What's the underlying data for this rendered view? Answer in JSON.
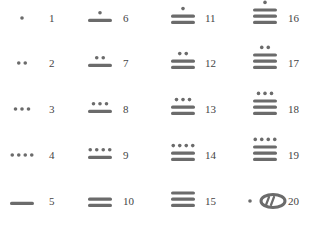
{
  "colors": {
    "glyph": "#6b6b6b",
    "label": "#444444",
    "background": "#ffffff"
  },
  "layout": {
    "columns": [
      {
        "glyph_x": 22,
        "label_x": 49
      },
      {
        "glyph_x": 100,
        "label_x": 123
      },
      {
        "glyph_x": 183,
        "label_x": 205
      },
      {
        "glyph_x": 265,
        "label_x": 288
      }
    ],
    "rows": [
      21,
      66,
      112,
      158,
      204
    ]
  },
  "numerals": [
    {
      "value": 1,
      "label": "1",
      "dots": 1,
      "bars": 0,
      "shell": false
    },
    {
      "value": 2,
      "label": "2",
      "dots": 2,
      "bars": 0,
      "shell": false
    },
    {
      "value": 3,
      "label": "3",
      "dots": 3,
      "bars": 0,
      "shell": false
    },
    {
      "value": 4,
      "label": "4",
      "dots": 4,
      "bars": 0,
      "shell": false
    },
    {
      "value": 5,
      "label": "5",
      "dots": 0,
      "bars": 1,
      "shell": false
    },
    {
      "value": 6,
      "label": "6",
      "dots": 1,
      "bars": 1,
      "shell": false
    },
    {
      "value": 7,
      "label": "7",
      "dots": 2,
      "bars": 1,
      "shell": false
    },
    {
      "value": 8,
      "label": "8",
      "dots": 3,
      "bars": 1,
      "shell": false
    },
    {
      "value": 9,
      "label": "9",
      "dots": 4,
      "bars": 1,
      "shell": false
    },
    {
      "value": 10,
      "label": "10",
      "dots": 0,
      "bars": 2,
      "shell": false
    },
    {
      "value": 11,
      "label": "11",
      "dots": 1,
      "bars": 2,
      "shell": false
    },
    {
      "value": 12,
      "label": "12",
      "dots": 2,
      "bars": 2,
      "shell": false
    },
    {
      "value": 13,
      "label": "13",
      "dots": 3,
      "bars": 2,
      "shell": false
    },
    {
      "value": 14,
      "label": "14",
      "dots": 4,
      "bars": 2,
      "shell": false
    },
    {
      "value": 15,
      "label": "15",
      "dots": 0,
      "bars": 3,
      "shell": false
    },
    {
      "value": 16,
      "label": "16",
      "dots": 1,
      "bars": 3,
      "shell": false
    },
    {
      "value": 17,
      "label": "17",
      "dots": 2,
      "bars": 3,
      "shell": false
    },
    {
      "value": 18,
      "label": "18",
      "dots": 3,
      "bars": 3,
      "shell": false
    },
    {
      "value": 19,
      "label": "19",
      "dots": 4,
      "bars": 3,
      "shell": false
    },
    {
      "value": 20,
      "label": "20",
      "dots": 1,
      "bars": 0,
      "shell": true
    }
  ],
  "legend": {
    "dot": "one",
    "bar": "five",
    "shell": "zero"
  }
}
